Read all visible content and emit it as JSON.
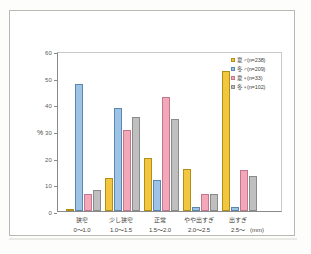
{
  "chart_data": {
    "type": "bar",
    "title": "",
    "xlabel": "",
    "ylabel": "%",
    "unit_note": "(mm)",
    "ylim": [
      0,
      60
    ],
    "yticks": [
      0,
      10,
      20,
      30,
      40,
      50,
      60
    ],
    "grid": false,
    "legend_position": "top-right",
    "categories": [
      "狭窄\n0〜1.0",
      "少し狭窄\n1.0〜1.5",
      "正常\n1.5〜2.0",
      "やや出すぎ\n2.0〜2.5",
      "出すぎ\n2.5〜"
    ],
    "category_labels": [
      {
        "name": "狭窄",
        "range": "0〜1.0"
      },
      {
        "name": "少し狭窄",
        "range": "1.0〜1.5"
      },
      {
        "name": "正常",
        "range": "1.5〜2.0"
      },
      {
        "name": "やや出すぎ",
        "range": "2.0〜2.5"
      },
      {
        "name": "出すぎ",
        "range": "2.5〜"
      }
    ],
    "series": [
      {
        "name": "夏♂(n=238)",
        "color": "#f3c63f",
        "values": [
          0.5,
          12.2,
          20.0,
          15.8,
          52.4
        ]
      },
      {
        "name": "冬♂(n=209)",
        "color": "#9dc3e6",
        "values": [
          47.5,
          38.5,
          11.6,
          1.6,
          1.6
        ]
      },
      {
        "name": "夏♀(n=33)",
        "color": "#f4a7b9",
        "values": [
          6.2,
          30.5,
          42.6,
          6.3,
          15.4
        ]
      },
      {
        "name": "冬♀(n=102)",
        "color": "#bfbfbf",
        "values": [
          8.0,
          35.4,
          34.6,
          6.3,
          13.1
        ]
      }
    ]
  },
  "colors": {
    "series_0": "#f3c63f",
    "series_1": "#9dc3e6",
    "series_2": "#f4a7b9",
    "series_3": "#bfbfbf",
    "axis": "#8a8a8a",
    "text": "#3f3f3c",
    "page_border": "#b9b9b4"
  }
}
